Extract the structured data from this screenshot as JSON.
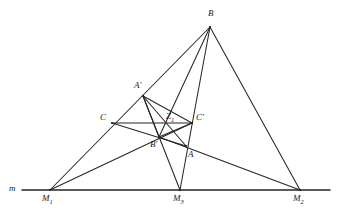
{
  "figure": {
    "kind": "geometry-diagram",
    "title": "",
    "background": "#ffffff",
    "stroke_color": "#262626",
    "label_color": "#1a1a1a",
    "width": 341,
    "height": 219
  },
  "labels": {
    "m": "m",
    "M1": "M",
    "M1_sub": "1",
    "M2": "M",
    "M2_sub": "2",
    "M3": "M",
    "M3_sub": "3",
    "A": "A",
    "B": "B",
    "C": "C",
    "Aprime": "A'",
    "Bprime": "B'",
    "Cprime": "C'",
    "Z": "Z",
    "Z_sub": "1"
  },
  "points": {
    "M1": {
      "x": 50,
      "y": 190,
      "label": "M1"
    },
    "M2": {
      "x": 300,
      "y": 190,
      "label": "M2"
    },
    "M3": {
      "x": 180,
      "y": 190,
      "label": "M3"
    },
    "A": {
      "x": 186,
      "y": 146,
      "label": "A"
    },
    "B": {
      "x": 210,
      "y": 27,
      "label": "B"
    },
    "C": {
      "x": 112,
      "y": 123,
      "label": "C"
    },
    "Aprime": {
      "x": 143,
      "y": 96,
      "label": "A'"
    },
    "Bprime": {
      "x": 159,
      "y": 137,
      "label": "B'"
    },
    "Cprime": {
      "x": 192,
      "y": 123,
      "label": "C'"
    },
    "Z": {
      "x": 171,
      "y": 124,
      "label": "Z1"
    }
  },
  "axis_line": {
    "name": "line-m",
    "x1": 22,
    "y1": 190,
    "x2": 330,
    "y2": 190
  },
  "segments": [
    {
      "name": "seg-M1-B",
      "from": "M1",
      "to": "B"
    },
    {
      "name": "seg-M1-Cprime",
      "from": "M1",
      "to": "Cprime"
    },
    {
      "name": "seg-M2-B",
      "from": "M2",
      "to": "B"
    },
    {
      "name": "seg-M2-Bprime",
      "from": "M2",
      "to": "Bprime"
    },
    {
      "name": "seg-M3-Aprime",
      "from": "M3",
      "to": "Aprime"
    },
    {
      "name": "seg-M3-B",
      "from": "M3",
      "to": "B"
    },
    {
      "name": "seg-C-Cprime",
      "from": "C",
      "to": "Cprime"
    },
    {
      "name": "seg-C-A",
      "from": "C",
      "to": "A"
    },
    {
      "name": "seg-Aprime-A",
      "from": "Aprime",
      "to": "A"
    },
    {
      "name": "seg-Aprime-Cprime",
      "from": "Aprime",
      "to": "Cprime"
    },
    {
      "name": "seg-Aprime-Bprime",
      "from": "Aprime",
      "to": "Bprime"
    },
    {
      "name": "seg-Bprime-Cprime",
      "from": "Bprime",
      "to": "Cprime"
    },
    {
      "name": "seg-Bprime-B",
      "from": "Bprime",
      "to": "B"
    }
  ],
  "label_positions": {
    "m": {
      "x": 9,
      "y": 184
    },
    "M1": {
      "x": 42,
      "y": 194
    },
    "M2": {
      "x": 293,
      "y": 194
    },
    "M3": {
      "x": 173,
      "y": 194
    },
    "A": {
      "x": 188,
      "y": 150
    },
    "B": {
      "x": 208,
      "y": 9
    },
    "C": {
      "x": 100,
      "y": 113
    },
    "Aprime": {
      "x": 134,
      "y": 81
    },
    "Bprime": {
      "x": 150,
      "y": 140
    },
    "Cprime": {
      "x": 196,
      "y": 113
    },
    "Z": {
      "x": 166,
      "y": 112
    }
  }
}
